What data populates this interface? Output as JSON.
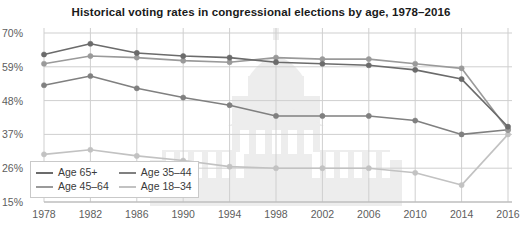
{
  "chart_data": {
    "type": "line",
    "title": "Historical voting rates in congressional elections by age, 1978–2016",
    "xlabel": "",
    "ylabel": "",
    "x": [
      1978,
      1982,
      1986,
      1990,
      1994,
      1998,
      2002,
      2006,
      2010,
      2014,
      2016
    ],
    "xtick_labels": [
      "1978",
      "1982",
      "1986",
      "1990",
      "1994",
      "1998",
      "2002",
      "2006",
      "2010",
      "2014",
      "2016"
    ],
    "ytick_labels": [
      "70%",
      "59%",
      "48%",
      "37%",
      "26%",
      "15%"
    ],
    "ytick_values": [
      70,
      59,
      48,
      37,
      26,
      15
    ],
    "ylim": [
      15,
      70
    ],
    "xlim": [
      1978,
      2016
    ],
    "grid": true,
    "legend_position": "bottom-left",
    "series": [
      {
        "name": "Age 65+",
        "color": "#6b6b6b",
        "values": [
          63.0,
          66.5,
          63.5,
          62.5,
          62.0,
          60.5,
          60.0,
          59.5,
          58.0,
          55.0,
          39.5
        ]
      },
      {
        "name": "Age 45–64",
        "color": "#9a9a9a",
        "values": [
          60.0,
          62.5,
          62.0,
          61.0,
          60.5,
          62.0,
          61.5,
          61.5,
          60.0,
          58.5,
          38.5
        ]
      },
      {
        "name": "Age 35–44",
        "color": "#808080",
        "values": [
          53.0,
          56.0,
          52.0,
          49.0,
          46.5,
          43.0,
          43.0,
          43.0,
          41.5,
          37.0,
          38.5
        ]
      },
      {
        "name": "Age 18–34",
        "color": "#c2c2c2",
        "values": [
          30.5,
          32.0,
          30.0,
          28.5,
          26.5,
          26.0,
          26.0,
          26.0,
          24.5,
          20.5,
          37.0
        ]
      }
    ]
  },
  "legend": {
    "items": [
      {
        "label": "Age 65+",
        "color": "#6b6b6b"
      },
      {
        "label": "Age 35–44",
        "color": "#808080"
      },
      {
        "label": "Age 45–64",
        "color": "#9a9a9a"
      },
      {
        "label": "Age 18–34",
        "color": "#c2c2c2"
      }
    ]
  },
  "watermark": {
    "name": "capitol-building-watermark",
    "color": "#ededed"
  }
}
